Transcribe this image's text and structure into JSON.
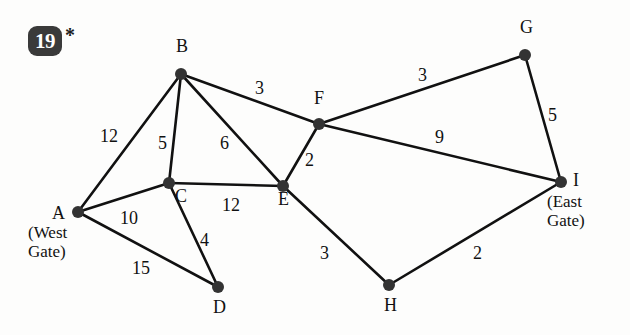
{
  "figure": {
    "badge_number": "19",
    "badge_marker": "*",
    "type": "weighted-undirected-graph"
  },
  "chart_data": {
    "type": "diagram",
    "title": "",
    "nodes": [
      {
        "id": "A",
        "label": "A",
        "sublabel": "(West\nGate)",
        "sublabel_line1": "(West",
        "sublabel_line2": "Gate)",
        "x": 78,
        "y": 212
      },
      {
        "id": "B",
        "label": "B",
        "sublabel": "",
        "x": 181,
        "y": 74
      },
      {
        "id": "C",
        "label": "C",
        "sublabel": "",
        "x": 169,
        "y": 183
      },
      {
        "id": "D",
        "label": "D",
        "sublabel": "",
        "x": 218,
        "y": 287
      },
      {
        "id": "E",
        "label": "E",
        "sublabel": "",
        "x": 283,
        "y": 186
      },
      {
        "id": "F",
        "label": "F",
        "sublabel": "",
        "x": 319,
        "y": 124
      },
      {
        "id": "G",
        "label": "G",
        "sublabel": "",
        "x": 525,
        "y": 55
      },
      {
        "id": "H",
        "label": "H",
        "sublabel": "",
        "x": 389,
        "y": 285
      },
      {
        "id": "I",
        "label": "I",
        "sublabel": "(East\nGate)",
        "sublabel_line1": "(East",
        "sublabel_line2": "Gate)",
        "x": 561,
        "y": 182
      }
    ],
    "edges": [
      {
        "from": "A",
        "to": "B",
        "weight": "12",
        "lx": 100,
        "ly": 126
      },
      {
        "from": "A",
        "to": "C",
        "weight": "10",
        "lx": 120,
        "ly": 208
      },
      {
        "from": "A",
        "to": "D",
        "weight": "15",
        "lx": 132,
        "ly": 258
      },
      {
        "from": "B",
        "to": "C",
        "weight": "5",
        "lx": 158,
        "ly": 133
      },
      {
        "from": "B",
        "to": "E",
        "weight": "6",
        "lx": 220,
        "ly": 133
      },
      {
        "from": "B",
        "to": "F",
        "weight": "3",
        "lx": 255,
        "ly": 78
      },
      {
        "from": "C",
        "to": "D",
        "weight": "4",
        "lx": 200,
        "ly": 230
      },
      {
        "from": "C",
        "to": "E",
        "weight": "12",
        "lx": 222,
        "ly": 195
      },
      {
        "from": "E",
        "to": "F",
        "weight": "2",
        "lx": 305,
        "ly": 150
      },
      {
        "from": "E",
        "to": "H",
        "weight": "3",
        "lx": 320,
        "ly": 243
      },
      {
        "from": "F",
        "to": "G",
        "weight": "3",
        "lx": 418,
        "ly": 65
      },
      {
        "from": "F",
        "to": "I",
        "weight": "9",
        "lx": 435,
        "ly": 127
      },
      {
        "from": "G",
        "to": "I",
        "weight": "5",
        "lx": 548,
        "ly": 105
      },
      {
        "from": "H",
        "to": "I",
        "weight": "2",
        "lx": 473,
        "ly": 243
      }
    ],
    "node_label_offsets": {
      "A": {
        "dx": -26,
        "dy": -9
      },
      "B": {
        "dx": -5,
        "dy": -38
      },
      "C": {
        "dx": 6,
        "dy": 3
      },
      "D": {
        "dx": -5,
        "dy": 10
      },
      "E": {
        "dx": -5,
        "dy": 3
      },
      "F": {
        "dx": -5,
        "dy": -36
      },
      "G": {
        "dx": -5,
        "dy": -38
      },
      "H": {
        "dx": -5,
        "dy": 10
      },
      "I": {
        "dx": 12,
        "dy": -12
      }
    },
    "style": {
      "node_color": "#333333",
      "edge_color": "#111111",
      "text_color": "#111111",
      "background": "#fdfdfc",
      "node_radius": 6,
      "edge_width": 2.6
    }
  }
}
